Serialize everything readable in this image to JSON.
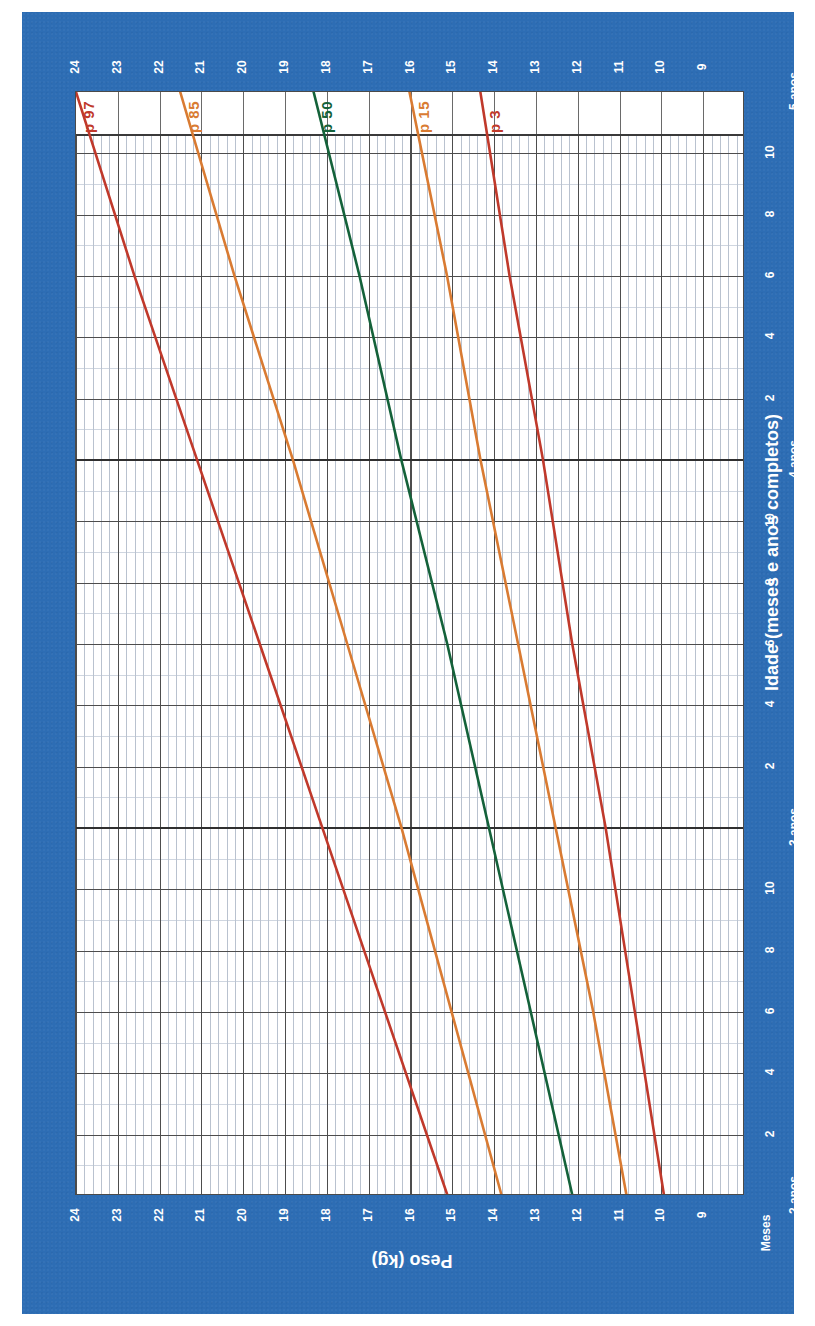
{
  "title": "De 2 a 5 anos (percentis)",
  "colors": {
    "background": "#2d6db4",
    "plot_background": "#ffffff",
    "p97": "#c0392b",
    "p85": "#d97b32",
    "p50": "#14623a",
    "p15": "#d97b32",
    "p3": "#c0392b",
    "grid_major": "#4d4d4d",
    "grid_minor": "#b9c2cf",
    "axis_text": "#ffffff"
  },
  "axes": {
    "y_label": "Peso (kg)",
    "x_label": "Idade (meses e anos completos)",
    "months_label": "Meses",
    "y_ticks": [
      24,
      23,
      22,
      21,
      20,
      19,
      18,
      17,
      16,
      15,
      14,
      13,
      12,
      11,
      10,
      9
    ],
    "y_range": [
      8,
      24
    ],
    "x_major_ticks": [
      "2 anos",
      "3 anos",
      "4 anos",
      "5 anos"
    ],
    "x_minor_ticks": [
      "2",
      "4",
      "6",
      "8",
      "10"
    ],
    "x_range_months": [
      24,
      60
    ]
  },
  "percentile_labels": [
    {
      "name": "p-97-label",
      "text": "p 97",
      "color": "#c0392b"
    },
    {
      "name": "p-85-label",
      "text": "p 85",
      "color": "#d97b32"
    },
    {
      "name": "p-50-label",
      "text": "p 50",
      "color": "#14623a"
    },
    {
      "name": "p-15-label",
      "text": "p 15",
      "color": "#d97b32"
    },
    {
      "name": "p-3-label",
      "text": "p 3",
      "color": "#c0392b"
    }
  ],
  "chart_data": {
    "type": "line",
    "title": "De 2 a 5 anos (percentis)",
    "xlabel": "Idade (meses e anos completos)",
    "ylabel": "Peso (kg)",
    "xlim": [
      24,
      60
    ],
    "ylim": [
      8,
      24
    ],
    "grid": true,
    "legend": "inline-end-labels",
    "x_months": [
      24,
      30,
      36,
      42,
      48,
      54,
      60
    ],
    "series": [
      {
        "name": "p 97",
        "color": "#c0392b",
        "values": [
          15.1,
          16.6,
          18.1,
          19.6,
          21.1,
          22.6,
          24.0
        ]
      },
      {
        "name": "p 85",
        "color": "#d97b32",
        "values": [
          13.8,
          15.0,
          16.2,
          17.5,
          18.8,
          20.2,
          21.5
        ]
      },
      {
        "name": "p 50",
        "color": "#14623a",
        "values": [
          12.1,
          13.1,
          14.1,
          15.1,
          16.2,
          17.2,
          18.3
        ]
      },
      {
        "name": "p 15",
        "color": "#d97b32",
        "values": [
          10.8,
          11.6,
          12.5,
          13.4,
          14.3,
          15.1,
          16.0
        ]
      },
      {
        "name": "p 3",
        "color": "#c0392b",
        "values": [
          9.9,
          10.6,
          11.3,
          12.1,
          12.8,
          13.6,
          14.3
        ]
      }
    ]
  }
}
